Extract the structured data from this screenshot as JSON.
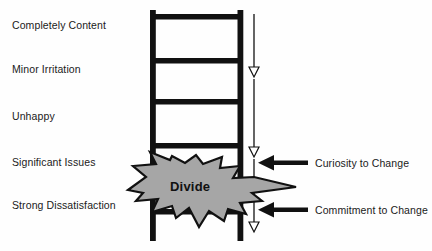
{
  "diagram": {
    "title_text": "Divide",
    "background_color": "#fefefe",
    "ink_color": "#111111",
    "star_fill_color": "#a6a6a6",
    "scale_labels": [
      {
        "label": "Completely Content",
        "y": 24
      },
      {
        "label": "Minor Irritation",
        "y": 68
      },
      {
        "label": "Unhappy",
        "y": 115
      },
      {
        "label": "Significant Issues",
        "y": 161
      },
      {
        "label": "Strong Dissatisfaction",
        "y": 204
      }
    ],
    "callouts": [
      {
        "label": "Curiosity to Change",
        "y": 157
      },
      {
        "label": "Commitment to Change",
        "y": 204
      }
    ],
    "ladder": {
      "rail_left_x": 150,
      "rail_right_x": 237,
      "rung_y": [
        16,
        60,
        100,
        145,
        210
      ],
      "rail_top": 10,
      "rail_bottom": 240
    },
    "progress_axis": {
      "x": 254,
      "top": 14,
      "bottom": 232,
      "arrowhead_y": [
        72,
        152,
        228
      ]
    }
  }
}
